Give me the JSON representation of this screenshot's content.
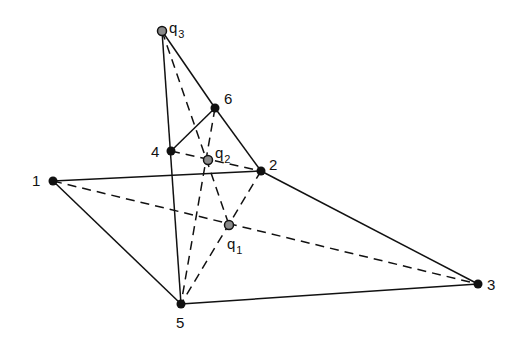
{
  "diagram": {
    "title": "",
    "points": [
      {
        "id": "1",
        "x": 53,
        "y": 181,
        "kind": "vertex",
        "label": "1",
        "label_dx": -21,
        "label_dy": 5
      },
      {
        "id": "2",
        "x": 261,
        "y": 171,
        "kind": "vertex",
        "label": "2",
        "label_dx": 8,
        "label_dy": -1
      },
      {
        "id": "3",
        "x": 478,
        "y": 284,
        "kind": "vertex",
        "label": "3",
        "label_dx": 9,
        "label_dy": 6
      },
      {
        "id": "4",
        "x": 171,
        "y": 151,
        "kind": "vertex",
        "label": "4",
        "label_dx": -20,
        "label_dy": 6
      },
      {
        "id": "5",
        "x": 181,
        "y": 304,
        "kind": "vertex",
        "label": "5",
        "label_dx": -5,
        "label_dy": 24
      },
      {
        "id": "6",
        "x": 215,
        "y": 108,
        "kind": "vertex",
        "label": "6",
        "label_dx": 9,
        "label_dy": -4
      },
      {
        "id": "q1",
        "x": 229,
        "y": 225,
        "kind": "query",
        "label": "q",
        "sub": "1",
        "label_dx": -2,
        "label_dy": 24
      },
      {
        "id": "q2",
        "x": 208,
        "y": 160,
        "kind": "query",
        "label": "q",
        "sub": "2",
        "label_dx": 7,
        "label_dy": -2
      },
      {
        "id": "q3",
        "x": 162,
        "y": 31,
        "kind": "query",
        "label": "q",
        "sub": "3",
        "label_dx": 7,
        "label_dy": 2
      }
    ],
    "solid_edges": [
      [
        "1",
        "2"
      ],
      [
        "1",
        "5"
      ],
      [
        "5",
        "3"
      ],
      [
        "2",
        "3"
      ],
      [
        "q3",
        "5"
      ],
      [
        "q3",
        "6"
      ],
      [
        "6",
        "2"
      ],
      [
        "6",
        "4"
      ]
    ],
    "dashed_edges": [
      [
        "1",
        "3"
      ],
      [
        "q3",
        "q1"
      ],
      [
        "4",
        "2"
      ],
      [
        "6",
        "5"
      ],
      [
        "2",
        "5"
      ]
    ],
    "colors": {
      "line": "#111111",
      "vertex_fill": "#111111",
      "query_fill": "#8a8a8a",
      "background": "#ffffff"
    }
  }
}
